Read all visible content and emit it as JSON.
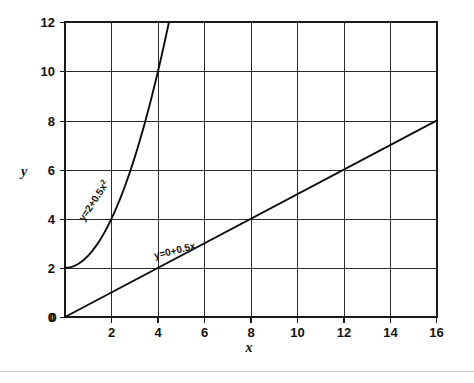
{
  "chart_data": {
    "type": "line",
    "title": "",
    "xlabel": "x",
    "ylabel": "y",
    "xlim": [
      0,
      16
    ],
    "ylim": [
      0,
      12
    ],
    "xticks": [
      0,
      2,
      4,
      6,
      8,
      10,
      12,
      14,
      16
    ],
    "xtick_labels": [
      "0",
      "2",
      "4",
      "6",
      "8",
      "10",
      "12",
      "14",
      "16"
    ],
    "yticks": [
      0,
      2,
      4,
      6,
      8,
      10,
      12
    ],
    "ytick_labels": [
      "0",
      "2",
      "4",
      "6",
      "8",
      "10",
      "12"
    ],
    "grid": true,
    "grid_x": [
      2,
      4,
      6,
      8,
      10,
      12,
      14
    ],
    "grid_y": [
      2,
      4,
      6,
      8,
      10
    ],
    "legend": "none",
    "series": [
      {
        "name": "quadratic",
        "label": "y=2+0.5x²",
        "label_base": "y=2+0.5x",
        "label_exponent": "2",
        "equation": "y = 2 + 0.5x^2",
        "intercept": 2,
        "coefficient": 0.5,
        "power": 2,
        "x": [
          0,
          0.5,
          1,
          1.5,
          2,
          2.5,
          3,
          3.5,
          4,
          4.25,
          4.47
        ],
        "y": [
          2,
          2.125,
          2.5,
          3.125,
          4,
          5.125,
          6.5,
          8.125,
          10,
          11.03,
          12
        ],
        "clipped_at_top": true,
        "label_rotation_deg": -57
      },
      {
        "name": "linear",
        "label": "y=0+0.5x",
        "equation": "y = 0 + 0.5x",
        "intercept": 0,
        "slope": 0.5,
        "x": [
          0,
          16
        ],
        "y": [
          0,
          8
        ],
        "clipped_at_top": false,
        "label_rotation_deg": -14
      }
    ],
    "annotations": [
      {
        "text": "y=2+0.5x²",
        "at_x": 1.0,
        "at_y": 4.3
      },
      {
        "text": "y=0+0.5x",
        "at_x": 5.1,
        "at_y": 3.4
      }
    ],
    "colors": {
      "curve": "#0d0d0d",
      "grid": "#2b2b2b",
      "frame": "#1a1a1a",
      "text": "#111111",
      "background": "#ffffff",
      "bottom_rule": "#c8cacc"
    }
  }
}
